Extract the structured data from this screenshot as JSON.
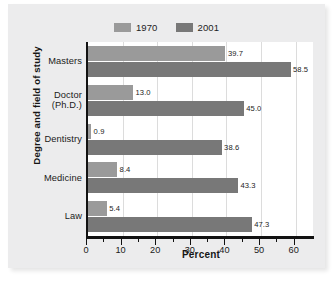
{
  "figure": {
    "background_color": "#ececed",
    "plot_background_color": "#ffffff",
    "axis_color": "#121212",
    "gridline_color": "#dcdcdc"
  },
  "legend": {
    "position": "top-center",
    "entries": [
      {
        "label": "1970",
        "color": "#9a9a9a",
        "swatch_name": "legend-swatch-1970"
      },
      {
        "label": "2001",
        "color": "#787878",
        "swatch_name": "legend-swatch-2001"
      }
    ]
  },
  "axes": {
    "y_title": "Degree and field of study",
    "x_title": "Percent",
    "x_major_ticks": [
      "0",
      "10",
      "20",
      "30",
      "40",
      "50",
      "60"
    ],
    "x_minor_tick_values": [
      5,
      15,
      25,
      35,
      45,
      55
    ],
    "x_min": 0,
    "x_max": 65
  },
  "chart_data": {
    "type": "bar",
    "orientation": "horizontal",
    "title": "",
    "xlabel": "Percent",
    "ylabel": "Degree and field of study",
    "xlim": [
      0,
      65
    ],
    "grid": true,
    "legend_position": "top-center",
    "categories": [
      "Masters",
      "Doctor (Ph.D.)",
      "Dentistry",
      "Medicine",
      "Law"
    ],
    "category_lines": [
      [
        "Masters"
      ],
      [
        "Doctor",
        "(Ph.D.)"
      ],
      [
        "Dentistry"
      ],
      [
        "Medicine"
      ],
      [
        "Law"
      ]
    ],
    "series": [
      {
        "name": "1970",
        "color": "#9a9a9a",
        "values": [
          39.7,
          13.0,
          0.9,
          8.4,
          5.4
        ],
        "labels": [
          "39.7",
          "13.0",
          "0.9",
          "8.4",
          "5.4"
        ]
      },
      {
        "name": "2001",
        "color": "#787878",
        "values": [
          58.5,
          45.0,
          38.6,
          43.3,
          47.3
        ],
        "labels": [
          "58.5",
          "45.0",
          "38.6",
          "43.3",
          "47.3"
        ]
      }
    ]
  }
}
